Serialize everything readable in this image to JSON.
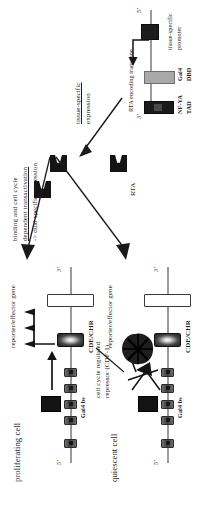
{
  "figure": {
    "panels": {
      "proliferating": {
        "cell_label": "proliferating cell",
        "five_prime": "5'",
        "three_prime": "3'",
        "gal4_bs_label": "Gal4 bs",
        "cde_chr_label": "CDE/CHR",
        "gene_label": "reporter/effector gene",
        "gal4_bs_count": 5,
        "transcription_active": true
      },
      "quiescent": {
        "cell_label": "quiescent cell",
        "five_prime": "5'",
        "three_prime": "3'",
        "gal4_bs_label": "Gal4 bs",
        "cde_chr_label": "CDE/CHR",
        "gene_label": "reporter/effector gene",
        "repressor_label_line1": "cell cycle regulated",
        "repressor_label_line2": "repressor (CDF-1)",
        "gal4_bs_count": 5,
        "transcription_active": false
      },
      "transgene": {
        "five_prime": "5'",
        "three_prime": "3'",
        "promoter_label_line1": "tissue-specific",
        "promoter_label_line2": "promoter",
        "transgene_label": "RTA encoding transgene",
        "dbd_label_line1": "Gal4",
        "dbd_label_line2": "DBD",
        "tad_label_line1": "NF-YA",
        "tad_label_line2": "TAD"
      },
      "protein": {
        "rta_label": "RTA",
        "count": 3
      }
    },
    "annotations": {
      "tissue_expression_line1": "tissue-specific",
      "tissue_expression_line2": "expression",
      "dual_specific_line1": "binding and cell cycle",
      "dual_specific_line2": "dependent transactivation",
      "dual_specific_line3": "-> dual specific expression"
    },
    "colors": {
      "background": "#ffffff",
      "ink": "#1a1a1a",
      "dna_backbone": "#9a9a9a",
      "gal4_bs_fill": "#3d3d3d",
      "protein_fill": "#141414",
      "dbd_fill": "#a9a9a9",
      "gene_fill": "#ffffff"
    }
  }
}
